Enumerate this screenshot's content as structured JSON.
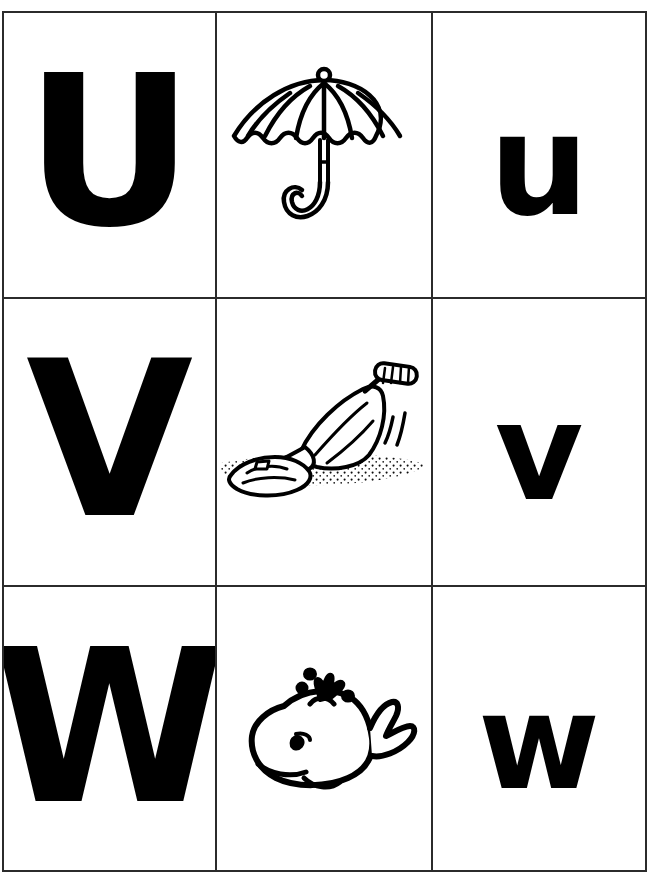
{
  "page": {
    "background_color": "#ffffff",
    "border_color": "#2b2b2b",
    "ink_color": "#000000"
  },
  "grid": {
    "columns": 3,
    "rows": 3,
    "column_headers": [
      "uppercase-letter",
      "picture",
      "lowercase-letter"
    ]
  },
  "rows": [
    {
      "id": "row-u",
      "uppercase": "U",
      "lowercase": "u",
      "picture_name": "umbrella-icon",
      "picture_label": "umbrella"
    },
    {
      "id": "row-v",
      "uppercase": "V",
      "lowercase": "v",
      "picture_name": "vacuum-cleaner-icon",
      "picture_label": "vacuum cleaner"
    },
    {
      "id": "row-w",
      "uppercase": "W",
      "lowercase": "w",
      "picture_name": "whale-icon",
      "picture_label": "whale"
    }
  ]
}
